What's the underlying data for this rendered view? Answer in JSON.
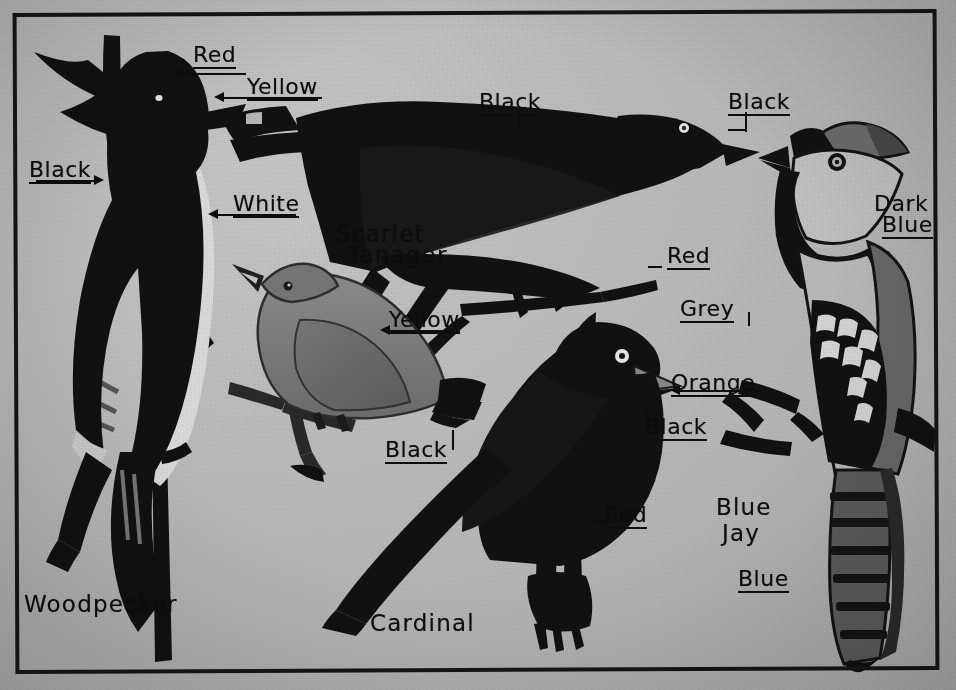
{
  "plate": {
    "title": "Bird color identification plate",
    "medium": "black and white halftone scan",
    "background_color": "#b8b8b8",
    "ink_color": "#0d0d0d",
    "frame_color": "#141414"
  },
  "birds": [
    {
      "id": "woodpecker",
      "name": "Woodpecker"
    },
    {
      "id": "scarlet-tanager",
      "name": "Scarlet\nTanager"
    },
    {
      "id": "cardinal",
      "name": "Cardinal"
    },
    {
      "id": "blue-jay",
      "name": "Blue\nJay"
    }
  ],
  "bird_names": {
    "woodpecker": "Woodpecker",
    "scarlet_tanager_line1": "Scarlet",
    "scarlet_tanager_line2": "Tanager",
    "cardinal": "Cardinal",
    "blue_jay_line1": "Blue",
    "blue_jay_line2": "Jay"
  },
  "color_labels": [
    {
      "id": "wp-red",
      "text": "Red",
      "bird": "woodpecker",
      "part": "crown"
    },
    {
      "id": "wp-yellow",
      "text": "Yellow",
      "bird": "woodpecker",
      "part": "bill"
    },
    {
      "id": "wp-black",
      "text": "Black",
      "bird": "woodpecker",
      "part": "back"
    },
    {
      "id": "wp-white",
      "text": "White",
      "bird": "woodpecker",
      "part": "breast"
    },
    {
      "id": "st-black-1",
      "text": "Black",
      "bird": "scarlet-tanager",
      "part": "wing"
    },
    {
      "id": "st-black-2",
      "text": "Black",
      "bird": "scarlet-tanager",
      "part": "bill"
    },
    {
      "id": "st-red",
      "text": "Red",
      "bird": "scarlet-tanager",
      "part": "body"
    },
    {
      "id": "fm-yellow",
      "text": "Yellow",
      "bird": "scarlet-tanager",
      "part": "female-body"
    },
    {
      "id": "fm-black",
      "text": "Black",
      "bird": "scarlet-tanager",
      "part": "female-tail"
    },
    {
      "id": "cd-orange",
      "text": "Orange",
      "bird": "cardinal",
      "part": "bill"
    },
    {
      "id": "cd-black",
      "text": "Black",
      "bird": "cardinal",
      "part": "throat"
    },
    {
      "id": "cd-red",
      "text": "Red",
      "bird": "cardinal",
      "part": "body"
    },
    {
      "id": "bj-dark-blue",
      "text": "Dark\nBlue",
      "bird": "blue-jay",
      "part": "back"
    },
    {
      "id": "bj-grey",
      "text": "Grey",
      "bird": "blue-jay",
      "part": "breast"
    },
    {
      "id": "bj-blue",
      "text": "Blue",
      "bird": "blue-jay",
      "part": "tail"
    }
  ],
  "labels": {
    "woodpecker_red": "Red",
    "woodpecker_yellow": "Yellow",
    "woodpecker_black": "Black",
    "woodpecker_white": "White",
    "tanager_black_wing": "Black",
    "tanager_black_bill": "Black",
    "tanager_red": "Red",
    "female_yellow": "Yellow",
    "female_black": "Black",
    "cardinal_orange": "Orange",
    "cardinal_black": "Black",
    "cardinal_red": "Red",
    "jay_dark": "Dark",
    "jay_blue_word": "Blue",
    "jay_grey": "Grey",
    "jay_tail_blue": "Blue"
  }
}
